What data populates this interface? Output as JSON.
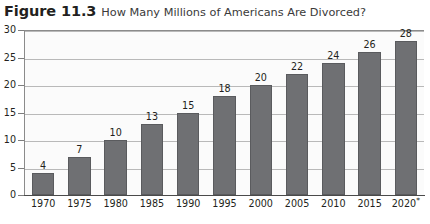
{
  "caption": {
    "number": "Figure 11.3",
    "text": "How Many Millions of Americans Are Divorced?"
  },
  "chart_data": {
    "type": "bar",
    "title": "How Many Millions of Americans Are Divorced?",
    "xlabel": "",
    "ylabel": "",
    "categories": [
      "1970",
      "1975",
      "1980",
      "1985",
      "1990",
      "1995",
      "2000",
      "2005",
      "2010",
      "2015",
      "2020*"
    ],
    "values": [
      4,
      7,
      10,
      13,
      15,
      18,
      20,
      22,
      24,
      26,
      28
    ],
    "value_labels": [
      "4",
      "7",
      "10",
      "13",
      "15",
      "18",
      "20",
      "22",
      "24",
      "26",
      "28"
    ],
    "ylim": [
      0,
      30
    ],
    "yticks": [
      0,
      5,
      10,
      15,
      20,
      25,
      30
    ],
    "ytick_labels": [
      "0",
      "5",
      "10",
      "15",
      "20",
      "25",
      "30"
    ],
    "grid": true,
    "legend": false,
    "bar_color": "#6f7073",
    "gridline_color": "#b9b9b9",
    "axis_color": "#4a4a4a",
    "plot_background": "#fbfbfb",
    "footnote_marker": "*"
  }
}
